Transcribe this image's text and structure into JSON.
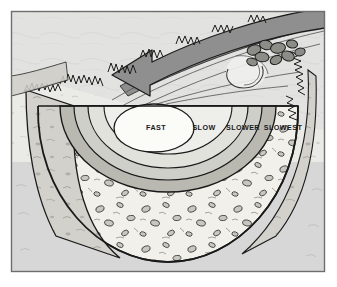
{
  "figure": {
    "frame": {
      "x": 11,
      "y": 11,
      "width": 314,
      "height": 261,
      "border_color": "#6e6e6e",
      "background_color": "#d8d8d8"
    },
    "scene": {
      "land_surface_color": "#e9e9e9",
      "water_surface_color": "#dedede",
      "streambed_color": "#f0efe9",
      "bank_color": "#cfcfc9",
      "outline_color": "#1a1a1a"
    },
    "flow_arrow": {
      "name": "flow-direction-arrow",
      "description": "curved arrow indicating downstream water flow direction",
      "fill_color": "#8f8f8f",
      "stroke_color": "#1a1a1a",
      "points_toward": "left"
    },
    "eddy": {
      "name": "water-swirl",
      "description": "swirl eddy in the water surface near the right bank"
    },
    "rocks": {
      "name": "bank-rock-cluster",
      "description": "cluster of dark rocks along the right bank"
    },
    "grass": {
      "name": "grass-bank-edge",
      "description": "tufted grass fringe along the top bank edges"
    },
    "streambed": {
      "name": "gravel-streambed",
      "description": "pebble and cobble filled streambed below the channel"
    }
  },
  "velocity_zones": {
    "title": "Water velocity zones",
    "zones": [
      {
        "label": "FAST",
        "order": 1,
        "fill_color": "#fbfbf8",
        "label_x": 132,
        "label_y": 128,
        "font_size": 7.2
      },
      {
        "label": "SLOW",
        "order": 2,
        "fill_color": "#e2e2dd",
        "label_x": 175,
        "label_y": 128,
        "font_size": 7.2
      },
      {
        "label": "SLOWER",
        "order": 3,
        "fill_color": "#cfcfc9",
        "label_x": 211,
        "label_y": 128,
        "font_size": 7.2
      },
      {
        "label": "SLOWEST",
        "order": 4,
        "fill_color": "#b9b9b2",
        "label_x": 252,
        "label_y": 128,
        "font_size": 7.2
      }
    ]
  }
}
